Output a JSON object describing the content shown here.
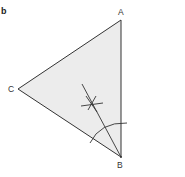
{
  "figure": {
    "panel_label": "b",
    "vertices": {
      "A": {
        "label": "A",
        "x": 121,
        "y": 20
      },
      "B": {
        "label": "B",
        "x": 121,
        "y": 157
      },
      "C": {
        "label": "C",
        "x": 18,
        "y": 89
      }
    },
    "colors": {
      "fill": "#ececec",
      "stroke": "#333333"
    }
  }
}
